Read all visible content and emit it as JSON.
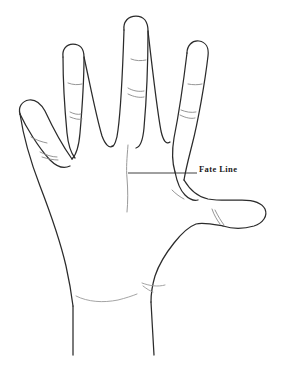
{
  "diagram": {
    "type": "line-drawing",
    "background_color": "#ffffff",
    "outline_color": "#2b2b2b",
    "crease_color": "#8a8a8a",
    "label_color": "#1a1a1a"
  },
  "annotations": [
    {
      "id": "fate-line",
      "label": "Fate Line",
      "leader": {
        "from_x": 128,
        "from_y": 173,
        "to_x": 197,
        "to_y": 173
      },
      "label_x": 199,
      "label_y": 165
    }
  ],
  "labels": {
    "fate_line": "Fate Line"
  },
  "parts": {
    "pinky": "pinky-finger",
    "ring": "ring-finger",
    "middle": "middle-finger",
    "index": "index-finger",
    "thumb": "thumb",
    "palm": "palm",
    "wrist": "wrist"
  }
}
